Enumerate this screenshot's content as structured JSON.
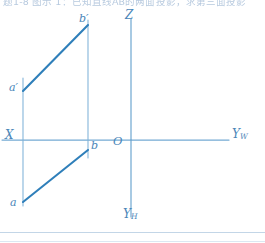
{
  "document": {
    "type": "descriptive-geometry-projection-drawing",
    "header_text": "题1-8 图示 1：已知直线AB的两面投影，求第三面投影",
    "ink_color": "#2f7fba",
    "axis_color": "#6aa7d2",
    "label_color": "#4a86b8",
    "background": "#ffffff"
  },
  "axes": [
    {
      "id": "x-axis",
      "label": "X",
      "sub": "",
      "label_x": 6,
      "label_y": 131,
      "orientation": "horizontal"
    },
    {
      "id": "z-axis",
      "label": "Z",
      "sub": "",
      "label_x": 125,
      "label_y": 12,
      "orientation": "vertical"
    },
    {
      "id": "yw-axis",
      "label": "Y",
      "sub": "W",
      "label_x": 232,
      "label_y": 129,
      "orientation": "horizontal"
    },
    {
      "id": "yh-axis",
      "label": "Y",
      "sub": "H",
      "label_x": 124,
      "label_y": 210,
      "orientation": "vertical"
    }
  ],
  "origin": {
    "label": "O",
    "label_x": 114,
    "label_y": 138
  },
  "points": [
    {
      "id": "a-prime",
      "label": "a",
      "prime": "′",
      "x": 23,
      "y": 91,
      "label_x": 10,
      "label_y": 84,
      "projection": "frontal"
    },
    {
      "id": "b-prime",
      "label": "b",
      "prime": "′",
      "x": 88,
      "y": 25,
      "label_x": 80,
      "label_y": 14,
      "projection": "frontal"
    },
    {
      "id": "a",
      "label": "a",
      "prime": "",
      "x": 23,
      "y": 202,
      "label_x": 10,
      "label_y": 199,
      "projection": "horizontal"
    },
    {
      "id": "b",
      "label": "b",
      "prime": "",
      "x": 88,
      "y": 150,
      "label_x": 91,
      "label_y": 142,
      "projection": "horizontal"
    }
  ],
  "segments": [
    {
      "id": "frontal-projection-ab",
      "from": "a-prime",
      "to": "b-prime",
      "weight": 2.1
    },
    {
      "id": "horizontal-projection-ab",
      "from": "a",
      "to": "b",
      "weight": 2.1
    },
    {
      "id": "projector-a",
      "from": "a-prime",
      "to": "a",
      "weight": 1.0
    },
    {
      "id": "projector-b",
      "from": "b-prime",
      "to": "b",
      "weight": 1.0
    }
  ],
  "geometry": {
    "x_axis_y": 140,
    "x_axis_x1": 0,
    "x_axis_x2": 228,
    "z_axis_x": 131,
    "z_axis_y1": 18,
    "z_axis_y2": 140,
    "yh_axis_y1": 140,
    "yh_axis_y2": 218,
    "projector_a_top": 78,
    "projector_a_bottom": 206,
    "projector_b_top": 20,
    "projector_b_bottom": 158
  }
}
